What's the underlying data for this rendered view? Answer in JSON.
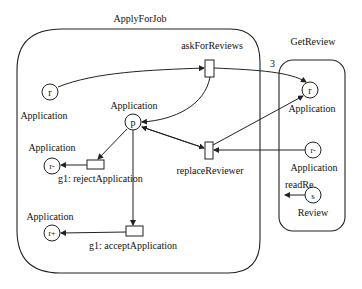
{
  "components": [
    {
      "id": "applyForJob",
      "title": "ApplyForJob"
    },
    {
      "id": "getReview",
      "title": "GetReview"
    }
  ],
  "places": [
    {
      "id": "afj_r",
      "token": "r",
      "type": "Application"
    },
    {
      "id": "afj_p",
      "token": "p",
      "type": "Application"
    },
    {
      "id": "afj_rminus",
      "token": "r-",
      "type": "Application"
    },
    {
      "id": "afj_rplus",
      "token": "r+",
      "type": "Application"
    },
    {
      "id": "gr_r",
      "token": "r",
      "type": "Application"
    },
    {
      "id": "gr_rminus",
      "token": "r-",
      "type": "Application"
    },
    {
      "id": "gr_s",
      "token": "s",
      "type": "Review"
    }
  ],
  "transitions": [
    {
      "id": "askForReviews",
      "label": "askForReviews"
    },
    {
      "id": "replaceReviewer",
      "label": "replaceReviewer"
    },
    {
      "id": "rejectApplication",
      "label": "g1: rejectApplication"
    },
    {
      "id": "acceptApplication",
      "label": "g1: acceptApplication"
    }
  ],
  "annotations": {
    "multiplicity": "3",
    "readRe": "readRe"
  }
}
